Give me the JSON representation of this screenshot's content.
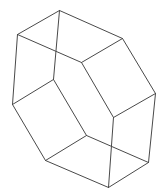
{
  "figure": {
    "type": "wireframe-polyhedron",
    "background": "#ffffff",
    "stroke": "#4a4a4a",
    "vertices": {
      "top": [
        59,
        10
      ],
      "upper_left": [
        17,
        34
      ],
      "upper_right": [
        122,
        38
      ],
      "inner_top_center": [
        81,
        62
      ],
      "inner_left_top": [
        53,
        79
      ],
      "right": [
        155,
        93
      ],
      "left": [
        12,
        104
      ],
      "inner_right": [
        113,
        117
      ],
      "inner_bottom": [
        86,
        135
      ],
      "bottom_left": [
        45,
        160
      ],
      "bottom_right": [
        148,
        162
      ],
      "bottom": [
        108,
        187
      ]
    },
    "edges": [
      [
        "top",
        "upper_left"
      ],
      [
        "top",
        "upper_right"
      ],
      [
        "top",
        "inner_left_top"
      ],
      [
        "upper_left",
        "inner_top_center"
      ],
      [
        "upper_left",
        "left"
      ],
      [
        "upper_right",
        "inner_top_center"
      ],
      [
        "upper_right",
        "right"
      ],
      [
        "inner_top_center",
        "inner_right"
      ],
      [
        "inner_left_top",
        "left"
      ],
      [
        "inner_left_top",
        "inner_bottom"
      ],
      [
        "left",
        "bottom_left"
      ],
      [
        "right",
        "inner_right"
      ],
      [
        "right",
        "bottom_right"
      ],
      [
        "inner_right",
        "bottom"
      ],
      [
        "inner_bottom",
        "bottom_left"
      ],
      [
        "inner_bottom",
        "bottom_right"
      ],
      [
        "bottom_left",
        "bottom"
      ],
      [
        "bottom_right",
        "bottom"
      ]
    ]
  }
}
